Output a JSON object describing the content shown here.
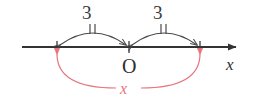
{
  "figure": {
    "background_color": "#ffffff",
    "axis": {
      "name": "x-axis",
      "label": "x",
      "label_style": "italic",
      "color": "#333333",
      "origin_label": "O",
      "start_x": 22,
      "end_x": 240,
      "y": 47,
      "arrow_direction": "right",
      "ticks": [
        {
          "name": "tick-left",
          "x": 57,
          "label": ""
        },
        {
          "name": "tick-origin",
          "x": 129,
          "label": "O"
        },
        {
          "name": "tick-right",
          "x": 200,
          "label": ""
        }
      ]
    },
    "measure_arcs": [
      {
        "name": "arc-left",
        "label": "3",
        "color": "#4a4a4a",
        "from_x": 57,
        "to_x": 129,
        "apex_y": 30,
        "hash_marks": 2,
        "arrowheads": "both"
      },
      {
        "name": "arc-right",
        "label": "3",
        "color": "#4a4a4a",
        "from_x": 129,
        "to_x": 200,
        "apex_y": 30,
        "hash_marks": 2,
        "arrowheads": "both"
      }
    ],
    "span_arc": {
      "name": "arc-total-x",
      "label": "x",
      "label_style": "italic",
      "color": "#e8747c",
      "from_x": 57,
      "to_x": 200,
      "bottom_y": 88,
      "arrowheads": "both",
      "arrow_direction": "up"
    }
  }
}
